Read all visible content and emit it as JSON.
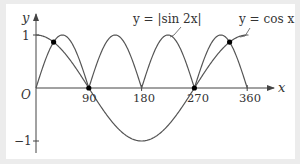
{
  "chart_data": {
    "type": "line",
    "title": "",
    "xlabel": "x",
    "ylabel": "y",
    "origin_label": "O",
    "xlim": [
      0,
      380
    ],
    "ylim": [
      -1.1,
      1.15
    ],
    "x_ticks": [
      90,
      180,
      270,
      360
    ],
    "x_tick_labels": [
      "90",
      "180",
      "270",
      "360"
    ],
    "y_ticks": [
      1,
      -1
    ],
    "y_tick_labels": [
      "1",
      "−1"
    ],
    "grid": false,
    "legend": "inline labels with leader lines",
    "series": [
      {
        "name": "y = |sin 2x|",
        "formula": "abs(sin(2x))",
        "x": [
          0,
          45,
          90,
          135,
          180,
          225,
          270,
          315,
          360
        ],
        "values": [
          0,
          1,
          0,
          1,
          0,
          1,
          0,
          1,
          0
        ]
      },
      {
        "name": "y = cos x",
        "formula": "cos(x)",
        "x": [
          0,
          30,
          90,
          180,
          270,
          330,
          360
        ],
        "values": [
          1,
          0.866,
          0,
          -1,
          0,
          0.866,
          1
        ]
      }
    ],
    "intersections": [
      {
        "x": 30,
        "y": 0.866
      },
      {
        "x": 90,
        "y": 0
      },
      {
        "x": 270,
        "y": 0
      },
      {
        "x": 330,
        "y": 0.866
      }
    ],
    "annotations": [
      "y = |sin 2x|",
      "y = cos x"
    ]
  },
  "labels": {
    "y_axis": "y",
    "x_axis": "x",
    "origin": "O",
    "tick_90": "90",
    "tick_180": "180",
    "tick_270": "270",
    "tick_360": "360",
    "tick_y1": "1",
    "tick_yneg1": "−1",
    "sin_label": "y = |sin 2x|",
    "cos_label": "y = cos x"
  },
  "colors": {
    "curve": "#555555",
    "axis": "#444444",
    "point": "#000000",
    "background": "#ffffff",
    "frame": "#ececec"
  }
}
